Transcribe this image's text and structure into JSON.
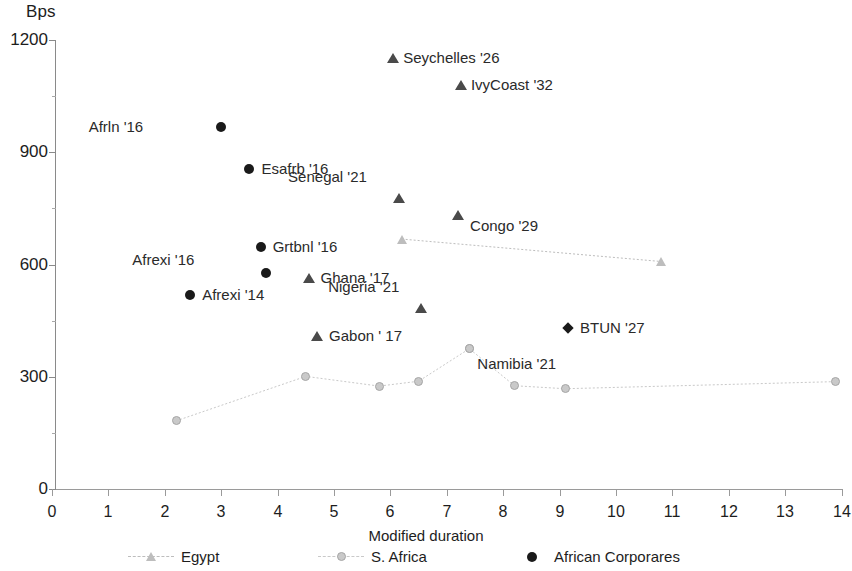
{
  "chart_data": {
    "type": "scatter",
    "title": "",
    "xlabel": "Modified duration",
    "ylabel": "Bps",
    "xlim": [
      0,
      14
    ],
    "ylim": [
      0,
      1200
    ],
    "grid": false,
    "x_ticks": [
      "0",
      "1",
      "2",
      "3",
      "4",
      "5",
      "6",
      "7",
      "8",
      "9",
      "10",
      "11",
      "12",
      "13",
      "14"
    ],
    "y_ticks": [
      "0",
      "300",
      "600",
      "900",
      "1200"
    ],
    "legend_position": "bottom",
    "series": [
      {
        "name": "Egypt",
        "marker": "triangle-light",
        "line": true,
        "color": "#bdbdbd",
        "points": [
          {
            "x": 6.2,
            "y": 668
          },
          {
            "x": 10.8,
            "y": 608
          }
        ]
      },
      {
        "name": "S. Africa",
        "marker": "circle-gray",
        "line": true,
        "color": "#c9c9c9",
        "points": [
          {
            "x": 2.2,
            "y": 182
          },
          {
            "x": 4.5,
            "y": 301
          },
          {
            "x": 5.8,
            "y": 275
          },
          {
            "x": 6.5,
            "y": 288
          },
          {
            "x": 7.4,
            "y": 375
          },
          {
            "x": 8.2,
            "y": 276
          },
          {
            "x": 9.1,
            "y": 268
          },
          {
            "x": 13.9,
            "y": 287
          }
        ]
      },
      {
        "name": "African Corporares",
        "marker": "circle-dark",
        "line": false,
        "color": "#1a1a1a",
        "points": [
          {
            "x": 3.0,
            "y": 968,
            "label": "Afrln '16"
          },
          {
            "x": 3.5,
            "y": 855,
            "label": "Esafrb '16"
          },
          {
            "x": 3.7,
            "y": 648,
            "label": "Grtbnl '16"
          },
          {
            "x": 3.8,
            "y": 578,
            "label": "Afrexi '16"
          },
          {
            "x": 2.45,
            "y": 518,
            "label": "Afrexi '14"
          },
          {
            "x": 9.15,
            "y": 430,
            "label": "BTUN '27",
            "marker": "diamond"
          }
        ]
      },
      {
        "name": "Sovereign (triangles)",
        "marker": "triangle",
        "line": false,
        "color": "#4a4a4a",
        "points": [
          {
            "x": 6.05,
            "y": 1152,
            "label": "Seychelles '26"
          },
          {
            "x": 7.25,
            "y": 1080,
            "label": "IvyCoast '32"
          },
          {
            "x": 6.15,
            "y": 777,
            "label": "Senegal '21"
          },
          {
            "x": 7.2,
            "y": 733,
            "label": "Congo '29"
          },
          {
            "x": 4.55,
            "y": 565,
            "label": "Ghana '17"
          },
          {
            "x": 6.55,
            "y": 483,
            "label": "Nigeria '21"
          },
          {
            "x": 4.7,
            "y": 408,
            "label": "Gabon ' 17"
          }
        ]
      }
    ],
    "annotations": [
      {
        "text": "Seychelles '26",
        "x": 6.05,
        "y": 1152
      },
      {
        "text": "IvyCoast '32",
        "x": 7.25,
        "y": 1080
      },
      {
        "text": "Afrln '16",
        "x": 3.0,
        "y": 968
      },
      {
        "text": "Esafrb '16",
        "x": 3.5,
        "y": 855
      },
      {
        "text": "Senegal '21",
        "x": 6.15,
        "y": 777
      },
      {
        "text": "Congo '29",
        "x": 7.2,
        "y": 733
      },
      {
        "text": "Grtbnl '16",
        "x": 3.7,
        "y": 648
      },
      {
        "text": "Afrexi '16",
        "x": 3.8,
        "y": 578
      },
      {
        "text": "Ghana '17",
        "x": 4.55,
        "y": 565
      },
      {
        "text": "Afrexi '14",
        "x": 2.45,
        "y": 518
      },
      {
        "text": "Nigeria '21",
        "x": 6.55,
        "y": 483
      },
      {
        "text": "BTUN '27",
        "x": 9.15,
        "y": 430
      },
      {
        "text": "Gabon ' 17",
        "x": 4.7,
        "y": 408
      },
      {
        "text": "Namibia '21",
        "x": 7.4,
        "y": 375
      }
    ]
  },
  "axes": {
    "y_title": "Bps",
    "x_title": "Modified duration",
    "y_ticks": [
      "1200",
      "900",
      "600",
      "300",
      "0"
    ],
    "x_ticks": [
      "0",
      "1",
      "2",
      "3",
      "4",
      "5",
      "6",
      "7",
      "8",
      "9",
      "10",
      "11",
      "12",
      "13",
      "14"
    ]
  },
  "labels": {
    "seychelles": "Seychelles '26",
    "ivycoast": "IvyCoast '32",
    "afrln": "Afrln '16",
    "esafrb": "Esafrb '16",
    "senegal": "Senegal '21",
    "congo": "Congo '29",
    "grtbnl": "Grtbnl '16",
    "afrexi16": "Afrexi '16",
    "ghana": "Ghana '17",
    "afrexi14": "Afrexi '14",
    "nigeria": "Nigeria '21",
    "btun": "BTUN '27",
    "gabon": "Gabon ' 17",
    "namibia": "Namibia '21"
  },
  "legend": {
    "items": [
      {
        "label": "Egypt",
        "marker": "triangle-light",
        "color": "#bdbdbd",
        "dashed": true
      },
      {
        "label": "S. Africa",
        "marker": "circle-gray",
        "color": "#c9c9c9",
        "dashed": true
      },
      {
        "label": "African Corporares",
        "marker": "circle-dark",
        "color": "#1a1a1a",
        "dashed": false
      }
    ]
  },
  "colors": {
    "axis": "#8a8a8a",
    "dark_marker": "#1a1a1a",
    "mid_marker": "#4a4a4a",
    "light_marker": "#bdbdbd",
    "gray_marker": "#c9c9c9",
    "text": "#1d1d1d"
  }
}
